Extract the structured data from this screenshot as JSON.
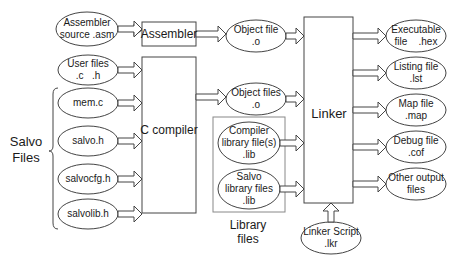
{
  "diagram": {
    "inputs": {
      "assembler_source": [
        "Assembler",
        "source .asm"
      ],
      "user_files": [
        "User files",
        ".c   .h"
      ],
      "salvo_files": [
        "mem.c",
        "salvo.h",
        "salvocfg.h",
        "salvolib.h"
      ],
      "salvo_group_label": [
        "Salvo",
        "Files"
      ]
    },
    "tools": {
      "assembler": "Assembler",
      "c_compiler": "C compiler",
      "linker": "Linker"
    },
    "intermediates": {
      "object_file": [
        "Object file",
        ".o"
      ],
      "object_files": [
        "Object files",
        ".o"
      ]
    },
    "libraries": {
      "group_label": [
        "Library",
        "files"
      ],
      "compiler_library": [
        "Compiler",
        "library file(s)",
        ".lib"
      ],
      "salvo_library": [
        "Salvo",
        "library files",
        ".lib"
      ]
    },
    "linker_script": [
      "Linker Script",
      ".lkr"
    ],
    "outputs": [
      [
        "Executable",
        "file    .hex"
      ],
      [
        "Listing file",
        ".lst"
      ],
      [
        "Map file",
        ".map"
      ],
      [
        "Debug file",
        ".cof"
      ],
      [
        "Other output",
        "files"
      ]
    ],
    "colors": {
      "stroke": "#444444",
      "text": "#1a1a1a",
      "library_box": "#888888",
      "background": "#ffffff"
    }
  }
}
